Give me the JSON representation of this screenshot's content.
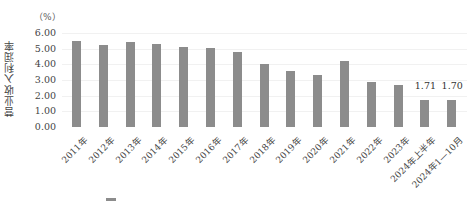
{
  "chart_data": {
    "type": "bar",
    "title": "",
    "xlabel": "",
    "ylabel": "营业收入利润率",
    "unit": "（%）",
    "ylim": [
      0,
      6
    ],
    "yticks": [
      "0.00",
      "1.00",
      "2.00",
      "3.00",
      "4.00",
      "5.00",
      "6.00"
    ],
    "grid": true,
    "bar_color": "#8c8c8c",
    "categories": [
      "2011年",
      "2012年",
      "2013年",
      "2014年",
      "2015年",
      "2016年",
      "2017年",
      "2018年",
      "2019年",
      "2020年",
      "2021年",
      "2022年",
      "2023年",
      "2024年上半年",
      "2024年1—10月"
    ],
    "values": [
      5.52,
      5.23,
      5.44,
      5.28,
      5.11,
      5.02,
      4.81,
      4.04,
      3.59,
      3.34,
      4.21,
      2.89,
      2.68,
      1.71,
      1.7
    ],
    "data_labels": [
      null,
      null,
      null,
      null,
      null,
      null,
      null,
      null,
      null,
      null,
      null,
      null,
      null,
      "1.71",
      "1.70"
    ],
    "legend_position": "bottom"
  }
}
